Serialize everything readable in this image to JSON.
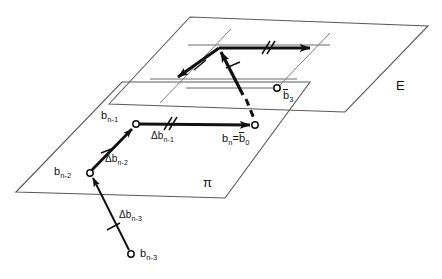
{
  "figure": {
    "title": "",
    "background_color": "#ffffff",
    "line_color": "#111111",
    "plane_edge_color": "#5a5a5a",
    "width": 442,
    "height": 279
  },
  "planes": [
    {
      "id": "plane-pi",
      "label": "π",
      "label_x": 205,
      "label_y": 180,
      "corners": [
        [
          16,
          192
        ],
        [
          122,
          82
        ],
        [
          310,
          82
        ],
        [
          225,
          198
        ]
      ]
    },
    {
      "id": "plane-E",
      "label": "E",
      "label_x": 399,
      "label_y": 86,
      "corners": [
        [
          109,
          104
        ],
        [
          190,
          17
        ],
        [
          428,
          26
        ],
        [
          345,
          112
        ]
      ]
    }
  ],
  "points": [
    {
      "id": "b-n-1",
      "label": "b",
      "sub": "n-1",
      "x": 136,
      "y": 124,
      "label_x": 104,
      "label_y": 112,
      "overbar": false
    },
    {
      "id": "b-n",
      "label": "b",
      "sub": "n",
      "x": 255,
      "y": 125,
      "label_x": 228,
      "label_y": 134,
      "overbar": false
    },
    {
      "id": "b-n-2",
      "label": "b",
      "sub": "n-2",
      "x": 90,
      "y": 173,
      "label_x": 56,
      "label_y": 167,
      "overbar": false
    },
    {
      "id": "b-n-3",
      "label": "b",
      "sub": "n-3",
      "x": 130,
      "y": 255,
      "label_x": 139,
      "label_y": 249,
      "overbar": false
    },
    {
      "id": "b-bar-3",
      "label": "b",
      "sub": "3",
      "x": 277,
      "y": 88,
      "label_x": 284,
      "label_y": 92,
      "overbar": true
    }
  ],
  "labels": {
    "b_n_equals_b_0": {
      "text_a": "b",
      "sub_a": "n",
      "eq": "=",
      "text_b": "b",
      "sub_b": "0"
    },
    "delta_b_n_1": {
      "delta": "Δ",
      "base": "b",
      "sub": "n-1",
      "x": 153,
      "y": 132
    },
    "delta_b_n_2": {
      "delta": "Δ",
      "base": "b",
      "sub": "n-2",
      "x": 107,
      "y": 155
    },
    "delta_b_n_3": {
      "delta": "Δ",
      "base": "b",
      "sub": "n-3",
      "x": 120,
      "y": 212
    },
    "plane_pi": "π",
    "plane_E": "E",
    "b_bar_3": {
      "base": "b",
      "sub": "3"
    }
  },
  "vectors": [
    {
      "id": "delta-b-n-1-pi",
      "name": "Δb_{n-1}",
      "from": [
        136,
        124
      ],
      "to": [
        252,
        125
      ],
      "ticks": 2,
      "style": "solid",
      "plane": "π"
    },
    {
      "id": "delta-b-n-2-pi",
      "name": "Δb_{n-2}",
      "from": [
        90,
        173
      ],
      "to": [
        133,
        127
      ],
      "ticks": 1,
      "style": "solid",
      "plane": "π"
    },
    {
      "id": "delta-b-n-3-pi",
      "name": "Δb_{n-3}",
      "from": [
        130,
        251
      ],
      "to": [
        92,
        177
      ],
      "ticks": 1,
      "style": "solid",
      "plane": "π"
    },
    {
      "id": "delta-b-n-1-E",
      "name": "Δb_{n-1} translated",
      "from": [
        219,
        48
      ],
      "to": [
        313,
        48
      ],
      "ticks": 2,
      "style": "solid",
      "plane": "E"
    },
    {
      "id": "delta-b-n-2-E",
      "name": "Δb_{n-2} reversed",
      "from": [
        219,
        48
      ],
      "to": [
        175,
        79
      ],
      "ticks": 1,
      "style": "solid",
      "plane": "E"
    },
    {
      "id": "resultant-E",
      "name": "resultant",
      "from": [
        243,
        94
      ],
      "to": [
        220,
        50
      ],
      "ticks": 1,
      "style": "solid",
      "plane": "E"
    },
    {
      "id": "projection-dashed",
      "name": "projection from b_n",
      "from": [
        248,
        103
      ],
      "to": [
        256,
        122
      ],
      "ticks": 0,
      "style": "dashed",
      "plane": "between"
    }
  ],
  "guide_lines": [
    {
      "id": "guide-E-upper",
      "from": [
        188,
        45
      ],
      "to": [
        328,
        45
      ]
    },
    {
      "id": "guide-E-lower",
      "from": [
        155,
        79
      ],
      "to": [
        295,
        79
      ]
    },
    {
      "id": "guide-E-b3",
      "from": [
        188,
        88
      ],
      "to": [
        277,
        88
      ]
    },
    {
      "id": "guide-E-diag",
      "from": [
        228,
        31
      ],
      "to": [
        163,
        100
      ]
    }
  ]
}
